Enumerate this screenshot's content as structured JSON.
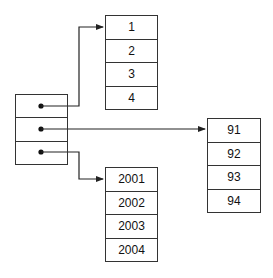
{
  "diagram": {
    "pointer_array": {
      "cells": 3
    },
    "arrays": {
      "top": {
        "values": [
          "1",
          "2",
          "3",
          "4"
        ]
      },
      "right": {
        "values": [
          "91",
          "92",
          "93",
          "94"
        ]
      },
      "bottom": {
        "values": [
          "2001",
          "2002",
          "2003",
          "2004"
        ]
      }
    },
    "arrows": [
      {
        "from": "pointer_array.0",
        "to": "top"
      },
      {
        "from": "pointer_array.1",
        "to": "right"
      },
      {
        "from": "pointer_array.2",
        "to": "bottom"
      }
    ],
    "line_color": "#222222"
  }
}
